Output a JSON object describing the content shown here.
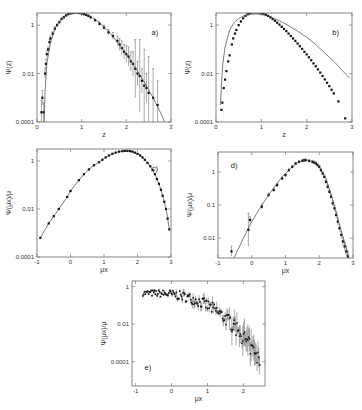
{
  "chart_data": [
    {
      "panel": "a)",
      "type": "scatter",
      "frame": {
        "x0": 37,
        "x1": 171,
        "y0": 13,
        "y1": 122
      },
      "xlabel": "z",
      "ylabel": "Ψ(z)",
      "xlim": [
        0,
        3
      ],
      "ylim_log10": [
        -4,
        0.5
      ],
      "xticks": [
        0,
        1,
        2,
        3
      ],
      "xticklabels": [
        "0",
        "1",
        "2",
        "3"
      ],
      "yticks_log10": [
        -4,
        -2,
        0
      ],
      "yticklabels": [
        "0.0001",
        "0.01",
        "1"
      ],
      "series": [
        {
          "name": "data",
          "style": "points_errorbars",
          "x": [
            0.1,
            0.12,
            0.15,
            0.18,
            0.2,
            0.22,
            0.25,
            0.28,
            0.3,
            0.35,
            0.4,
            0.45,
            0.5,
            0.55,
            0.6,
            0.65,
            0.7,
            0.75,
            0.8,
            0.85,
            0.9,
            0.95,
            1.0,
            1.05,
            1.1,
            1.15,
            1.2,
            1.3,
            1.4,
            1.5,
            1.6,
            1.7,
            1.8,
            1.85,
            1.9,
            1.95,
            2.0,
            2.05,
            2.1,
            2.15,
            2.2,
            2.25,
            2.3,
            2.35,
            2.4,
            2.45,
            2.5,
            2.6,
            2.7
          ],
          "y_log10": [
            -3.6,
            -3.0,
            -3.6,
            -2.0,
            -1.6,
            -1.2,
            -1.0,
            -0.7,
            -0.55,
            -0.35,
            -0.15,
            0.0,
            0.12,
            0.25,
            0.32,
            0.4,
            0.45,
            0.48,
            0.5,
            0.52,
            0.52,
            0.5,
            0.48,
            0.45,
            0.42,
            0.38,
            0.32,
            0.2,
            0.05,
            -0.1,
            -0.3,
            -0.45,
            -0.65,
            -0.8,
            -0.95,
            -1.1,
            -1.2,
            -1.3,
            -1.5,
            -1.6,
            -1.8,
            -2.0,
            -2.1,
            -2.3,
            -2.5,
            -2.6,
            -2.8,
            -3.0,
            -3.3
          ],
          "err": [
            0.5,
            0.3,
            0.4,
            0.2,
            0.2,
            0.15,
            0.1,
            0.1,
            0.1,
            0.08,
            0.08,
            0.05,
            0.05,
            0.05,
            0.05,
            0.04,
            0.04,
            0.04,
            0.04,
            0.04,
            0.04,
            0.04,
            0.04,
            0.04,
            0.05,
            0.05,
            0.05,
            0.06,
            0.08,
            0.1,
            0.12,
            0.15,
            0.2,
            0.25,
            0.3,
            0.3,
            0.35,
            0.4,
            0.4,
            0.5,
            1.2,
            0.5,
            1.5,
            0.5,
            1.5,
            0.6,
            1.5,
            1.2,
            1.0
          ]
        },
        {
          "name": "fit",
          "style": "line",
          "x": [
            0.15,
            0.18,
            0.22,
            0.3,
            0.4,
            0.5,
            0.6,
            0.7,
            0.8,
            0.9,
            1.0,
            1.2,
            1.4,
            1.6,
            1.8,
            2.0,
            2.2,
            2.4,
            2.6,
            2.8,
            2.9
          ],
          "y_log10": [
            -4.5,
            -2.8,
            -1.6,
            -0.75,
            -0.15,
            0.15,
            0.33,
            0.45,
            0.51,
            0.53,
            0.5,
            0.35,
            0.1,
            -0.25,
            -0.7,
            -1.2,
            -1.75,
            -2.35,
            -3.0,
            -3.75,
            -4.2
          ]
        }
      ]
    },
    {
      "panel": "b)",
      "type": "scatter",
      "frame": {
        "x0": 216,
        "x1": 352,
        "y0": 13,
        "y1": 122
      },
      "xlabel": "z",
      "ylabel": "Ψ(z)",
      "xlim": [
        0,
        3
      ],
      "ylim_log10": [
        -4,
        0.5
      ],
      "xticks": [
        0,
        1,
        2,
        3
      ],
      "xticklabels": [
        "0",
        "1",
        "2",
        "3"
      ],
      "yticks_log10": [
        -4,
        -2,
        0
      ],
      "yticklabels": [
        "0.0001",
        "0.01",
        "1"
      ],
      "series": [
        {
          "name": "data",
          "style": "points",
          "x": [
            0.12,
            0.14,
            0.17,
            0.2,
            0.23,
            0.27,
            0.3,
            0.35,
            0.38,
            0.42,
            0.45,
            0.5,
            0.55,
            0.6,
            0.65,
            0.7,
            0.75,
            0.8,
            0.85,
            0.9,
            0.95,
            1.0,
            1.05,
            1.1,
            1.15,
            1.2,
            1.25,
            1.3,
            1.35,
            1.4,
            1.45,
            1.5,
            1.55,
            1.6,
            1.65,
            1.7,
            1.75,
            1.8,
            1.85,
            1.9,
            1.95,
            2.0,
            2.05,
            2.1,
            2.15,
            2.2,
            2.25,
            2.3,
            2.35,
            2.4,
            2.45,
            2.5,
            2.55,
            2.6,
            2.7,
            2.85
          ],
          "y_log10": [
            -3.5,
            -3.2,
            -2.6,
            -2.25,
            -1.9,
            -1.5,
            -1.25,
            -0.8,
            -0.55,
            -0.35,
            -0.2,
            0.0,
            0.15,
            0.28,
            0.38,
            0.45,
            0.5,
            0.52,
            0.53,
            0.53,
            0.52,
            0.5,
            0.47,
            0.43,
            0.38,
            0.32,
            0.25,
            0.18,
            0.1,
            0.02,
            -0.07,
            -0.16,
            -0.25,
            -0.35,
            -0.45,
            -0.55,
            -0.65,
            -0.76,
            -0.87,
            -0.98,
            -1.1,
            -1.21,
            -1.33,
            -1.45,
            -1.58,
            -1.7,
            -1.83,
            -1.96,
            -2.1,
            -2.24,
            -2.38,
            -2.52,
            -2.67,
            -2.82,
            -3.15,
            -3.85
          ]
        },
        {
          "name": "model",
          "style": "line",
          "x": [
            0.1,
            0.12,
            0.15,
            0.2,
            0.3,
            0.4,
            0.5,
            0.6,
            0.7,
            0.8,
            0.9,
            1.0,
            1.1,
            1.2,
            1.4,
            1.6,
            1.8,
            2.0,
            2.2,
            2.4,
            2.6,
            2.8,
            2.95
          ],
          "y_log10": [
            -3.3,
            -2.5,
            -1.6,
            -0.9,
            -0.2,
            0.1,
            0.27,
            0.37,
            0.43,
            0.46,
            0.46,
            0.44,
            0.4,
            0.34,
            0.18,
            -0.02,
            -0.25,
            -0.5,
            -0.8,
            -1.15,
            -1.5,
            -1.9,
            -2.2
          ]
        }
      ]
    },
    {
      "panel": "c)",
      "type": "line",
      "frame": {
        "x0": 37,
        "x1": 171,
        "y0": 149,
        "y1": 257
      },
      "xlabel": "μx",
      "ylabel": "Ψ(μx)/μ",
      "xlim": [
        -1,
        3
      ],
      "ylim_log10": [
        -4,
        0.5
      ],
      "xticks": [
        -1,
        0,
        1,
        2,
        3
      ],
      "xticklabels": [
        "-1",
        "0",
        "1",
        "2",
        "3"
      ],
      "yticks_log10": [
        -4,
        -2,
        0
      ],
      "yticklabels": [
        "0.0001",
        "0.01",
        "1"
      ],
      "series": [
        {
          "name": "data",
          "style": "points_line",
          "x": [
            -0.9,
            -0.65,
            -0.5,
            -0.35,
            -0.1,
            0.0,
            0.25,
            0.4,
            0.55,
            0.7,
            0.85,
            0.95,
            1.05,
            1.15,
            1.25,
            1.35,
            1.45,
            1.55,
            1.62,
            1.7,
            1.78,
            1.85,
            1.92,
            2.0,
            2.08,
            2.15,
            2.22,
            2.3,
            2.38,
            2.45,
            2.52,
            2.58,
            2.64,
            2.7,
            2.75,
            2.8,
            2.85,
            2.9,
            2.95
          ],
          "y_log10": [
            -3.2,
            -2.6,
            -2.3,
            -2.0,
            -1.5,
            -1.25,
            -0.8,
            -0.55,
            -0.35,
            -0.18,
            -0.05,
            0.05,
            0.15,
            0.23,
            0.3,
            0.35,
            0.39,
            0.41,
            0.42,
            0.42,
            0.41,
            0.39,
            0.35,
            0.3,
            0.23,
            0.15,
            0.05,
            -0.08,
            -0.22,
            -0.38,
            -0.55,
            -0.75,
            -0.95,
            -1.2,
            -1.45,
            -1.7,
            -2.0,
            -2.4,
            -2.85
          ]
        }
      ]
    },
    {
      "panel": "d)",
      "type": "scatter",
      "frame": {
        "x0": 218,
        "x1": 353,
        "y0": 152,
        "y1": 258
      },
      "xlabel": "μx",
      "ylabel": "Ψ(μx)/μ",
      "xlim": [
        -1,
        3
      ],
      "ylim_log10": [
        -2.6,
        0.6
      ],
      "xticks": [
        -1,
        0,
        1,
        2,
        3
      ],
      "xticklabels": [
        "-1",
        "0",
        "1",
        "2",
        "3"
      ],
      "yticks_log10": [
        -2,
        -1,
        0
      ],
      "yticklabels": [
        "0.01",
        "0.1",
        "1"
      ],
      "series": [
        {
          "name": "data",
          "style": "points_errorbars",
          "x": [
            -0.6,
            -0.1,
            -0.05,
            0.3,
            0.5,
            0.65,
            0.75,
            0.9,
            1.0,
            1.1,
            1.2,
            1.3,
            1.4,
            1.5,
            1.55,
            1.6,
            1.7,
            1.8,
            1.85,
            1.9,
            1.95,
            2.0,
            2.05,
            2.1,
            2.15,
            2.2,
            2.25,
            2.3,
            2.35,
            2.4,
            2.45,
            2.5,
            2.55,
            2.6,
            2.65,
            2.7,
            2.75,
            2.8,
            2.85
          ],
          "y_log10": [
            -2.4,
            -1.75,
            -1.45,
            -1.05,
            -0.7,
            -0.55,
            -0.4,
            -0.2,
            -0.1,
            0.05,
            0.15,
            0.25,
            0.3,
            0.33,
            0.35,
            0.35,
            0.33,
            0.3,
            0.28,
            0.25,
            0.2,
            0.15,
            0.05,
            -0.05,
            -0.15,
            -0.3,
            -0.45,
            -0.6,
            -0.75,
            -0.95,
            -1.1,
            -1.3,
            -1.5,
            -1.7,
            -1.9,
            -2.1,
            -2.25,
            -2.4,
            -2.55
          ],
          "err": [
            0.15,
            0.5,
            0.1,
            0.08,
            0.06,
            0.05,
            0.05,
            0.04,
            0.04,
            0.04,
            0.04,
            0.04,
            0.04,
            0.04,
            0.04,
            0.04,
            0.04,
            0.04,
            0.04,
            0.04,
            0.04,
            0.05,
            0.05,
            0.05,
            0.05,
            0.06,
            0.06,
            0.06,
            0.07,
            0.08,
            0.08,
            0.1,
            0.1,
            0.1,
            0.1,
            0.12,
            0.12,
            0.15,
            0.15
          ]
        },
        {
          "name": "fit",
          "style": "line",
          "x": [
            -0.55,
            -0.2,
            0.0,
            0.3,
            0.6,
            0.9,
            1.2,
            1.4,
            1.6,
            1.8,
            2.0,
            2.2,
            2.4,
            2.6,
            2.8,
            2.9
          ],
          "y_log10": [
            -2.65,
            -1.9,
            -1.5,
            -1.0,
            -0.55,
            -0.15,
            0.15,
            0.3,
            0.36,
            0.32,
            0.15,
            -0.2,
            -0.85,
            -1.6,
            -2.3,
            -2.7
          ]
        }
      ]
    },
    {
      "panel": "e)",
      "type": "scatter",
      "frame": {
        "x0": 132,
        "x1": 265,
        "y0": 281,
        "y1": 386
      },
      "xlabel": "μx",
      "ylabel": "Ψ(μx)/μ",
      "xlim": [
        -1.1,
        2.6
      ],
      "ylim_log10": [
        -5.3,
        0.3
      ],
      "xticks": [
        -1,
        0,
        1,
        2
      ],
      "xticklabels": [
        "-1",
        "0",
        "1",
        "2"
      ],
      "yticks_log10": [
        -4,
        -2,
        0
      ],
      "yticklabels": [
        "0.0001",
        "0.01",
        "1"
      ],
      "series": [
        {
          "name": "data",
          "style": "dense_errorbars",
          "x_start": -0.8,
          "x_end": 2.45,
          "n": 140,
          "shape": "y_log10 = -0.35 - 0.25*(x+0.8)^2.6 approx; flat near -0.35 for x<0, falls to ~-4.8 at x=2.45",
          "noise": 0.15
        }
      ]
    }
  ],
  "labels": {
    "panels": [
      "a)",
      "b)",
      "c)",
      "d)",
      "e)"
    ],
    "x_axis": [
      "z",
      "z",
      "μx",
      "μx",
      "μx"
    ],
    "y_axis": [
      "Ψ(z)",
      "Ψ(z)",
      "Ψ(μx)/μ",
      "Ψ(μx)/μ",
      "Ψ(μx)/μ"
    ]
  }
}
